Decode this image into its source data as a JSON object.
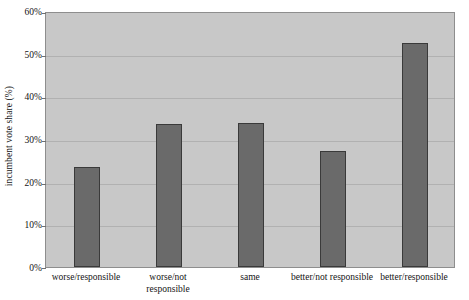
{
  "chart_data": {
    "type": "bar",
    "title": "",
    "xlabel": "",
    "ylabel": "incumbent vote share (%)",
    "categories": [
      "worse/responsible",
      "worse/not responsible",
      "same",
      "better/not responsible",
      "better/responsible"
    ],
    "category_lines": [
      [
        "worse/responsible"
      ],
      [
        "worse/not",
        "responsible"
      ],
      [
        "same"
      ],
      [
        "better/not responsible"
      ],
      [
        "better/responsible"
      ]
    ],
    "values": [
      23.4,
      33.5,
      33.7,
      27.2,
      52.5
    ],
    "ylim": [
      0,
      60
    ],
    "ytick_values": [
      0,
      10,
      20,
      30,
      40,
      50,
      60
    ],
    "ytick_labels": [
      "0%",
      "10%",
      "20%",
      "30%",
      "40%",
      "50%",
      "60%"
    ],
    "grid": true,
    "legend": "none",
    "colors": {
      "bar_fill": "#6a6a6a",
      "bar_border": "#3a3a3a",
      "plot_background": "#c8c8c8",
      "gridline": "#b1b1b1",
      "plot_border": "#8e8e8e",
      "page_background": "#ffffff",
      "text": "#141414"
    }
  }
}
